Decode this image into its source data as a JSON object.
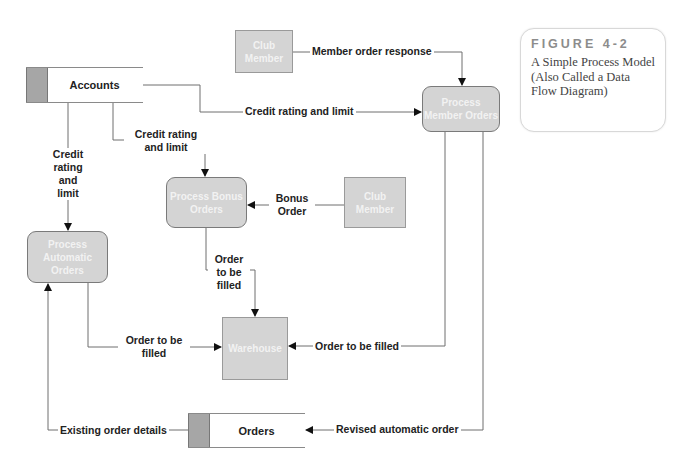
{
  "header": {
    "cut_text": "Systems Analysis and Design: Process Model"
  },
  "caption": {
    "figure_label": "FIGURE 4-2",
    "description": "A Simple Process Model (Also Called a Data Flow Diagram)"
  },
  "data_stores": {
    "accounts": "Accounts",
    "orders": "Orders"
  },
  "external_entities": {
    "club_member_top": "Club Member",
    "club_member_right": "Club Member",
    "warehouse": "Warehouse"
  },
  "processes": {
    "member_orders": "Process Member Orders",
    "bonus_orders": "Process Bonus Orders",
    "automatic_orders": "Process Automatic Orders"
  },
  "flows": {
    "member_order_response": "Member order response",
    "credit_rating_limit_member": "Credit rating and limit",
    "credit_rating_limit_bonus": "Credit rating and limit",
    "credit_rating_limit_auto": "Credit rating and limit",
    "bonus_order": "Bonus Order",
    "order_to_be_filled_bonus": "Order to be filled",
    "order_to_be_filled_auto": "Order to be filled",
    "order_to_be_filled_member": "Order to be filled",
    "existing_order_details": "Existing order details",
    "revised_automatic_order": "Revised automatic order"
  },
  "colors": {
    "process_fill": "#d4d4d4",
    "store_tab": "#a6a6a6",
    "line": "#6f6f6f",
    "caption_label": "#8c8c8c"
  }
}
